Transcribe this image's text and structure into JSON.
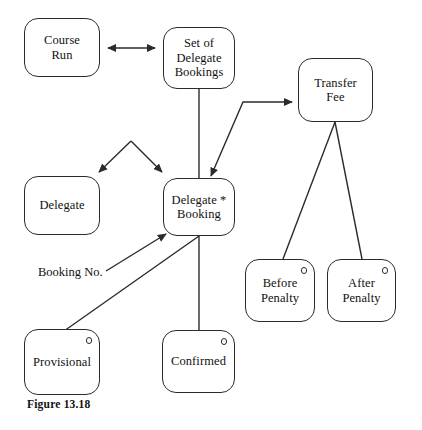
{
  "figure": {
    "caption": "Figure 13.18",
    "background_color": "#ffffff",
    "line_color": "#2b2b2b",
    "text_color": "#111111"
  },
  "nodes": [
    {
      "id": "course-run",
      "label": "Course\nRun",
      "kind": "entity",
      "has_state_marker": false,
      "x": 24,
      "y": 18,
      "w": 76,
      "h": 59
    },
    {
      "id": "set-of-delegate-bookings",
      "label": "Set of\nDelegate\nBookings",
      "kind": "entity",
      "has_state_marker": false,
      "x": 163,
      "y": 27,
      "w": 72,
      "h": 62
    },
    {
      "id": "transfer-fee",
      "label": "Transfer\nFee",
      "kind": "entity",
      "has_state_marker": false,
      "x": 298,
      "y": 58,
      "w": 75,
      "h": 64
    },
    {
      "id": "delegate",
      "label": "Delegate",
      "kind": "entity",
      "has_state_marker": false,
      "x": 24,
      "y": 176,
      "w": 76,
      "h": 59
    },
    {
      "id": "delegate-booking",
      "label": "Delegate *\nBooking",
      "kind": "entity",
      "has_state_marker": false,
      "x": 163,
      "y": 178,
      "w": 72,
      "h": 58
    },
    {
      "id": "before-penalty",
      "label": "Before\nPenalty",
      "kind": "state",
      "has_state_marker": true,
      "x": 245,
      "y": 259,
      "w": 70,
      "h": 63
    },
    {
      "id": "after-penalty",
      "label": "After\nPenalty",
      "kind": "state",
      "has_state_marker": true,
      "x": 327,
      "y": 259,
      "w": 69,
      "h": 63
    },
    {
      "id": "provisional",
      "label": "Provisional",
      "kind": "state",
      "has_state_marker": true,
      "x": 24,
      "y": 329,
      "w": 76,
      "h": 66
    },
    {
      "id": "confirmed",
      "label": "Confirmed",
      "kind": "state",
      "has_state_marker": true,
      "x": 162,
      "y": 330,
      "w": 73,
      "h": 63
    }
  ],
  "edges": [
    {
      "id": "course-run-to-set-of-delegate-bookings",
      "from": "course-run",
      "to": "set-of-delegate-bookings",
      "arrows": "both"
    },
    {
      "id": "set-of-delegate-bookings-to-delegate-booking",
      "from": "set-of-delegate-bookings",
      "to": "delegate-booking",
      "arrows": "none"
    },
    {
      "id": "fork-to-delegate",
      "from": "fork-apex",
      "to": "delegate",
      "arrows": "end"
    },
    {
      "id": "fork-to-delegate-booking",
      "from": "fork-apex",
      "to": "delegate-booking",
      "arrows": "end"
    },
    {
      "id": "delegate-booking-to-transfer-fee",
      "from": "delegate-booking",
      "to": "transfer-fee",
      "arrows": "end"
    },
    {
      "id": "transfer-fee-to-before-penalty",
      "from": "transfer-fee",
      "to": "before-penalty",
      "arrows": "none"
    },
    {
      "id": "transfer-fee-to-after-penalty",
      "from": "transfer-fee",
      "to": "after-penalty",
      "arrows": "none"
    },
    {
      "id": "booking-no-leader",
      "from": "booking-no-label",
      "to": "delegate-booking",
      "arrows": "end"
    },
    {
      "id": "provisional-to-delegate-booking",
      "from": "provisional",
      "to": "delegate-booking",
      "arrows": "none"
    },
    {
      "id": "confirmed-to-delegate-booking",
      "from": "confirmed",
      "to": "delegate-booking",
      "arrows": "none"
    }
  ],
  "edge_labels": [
    {
      "id": "booking-no",
      "text": "Booking No.",
      "x": 38,
      "y": 265
    }
  ]
}
